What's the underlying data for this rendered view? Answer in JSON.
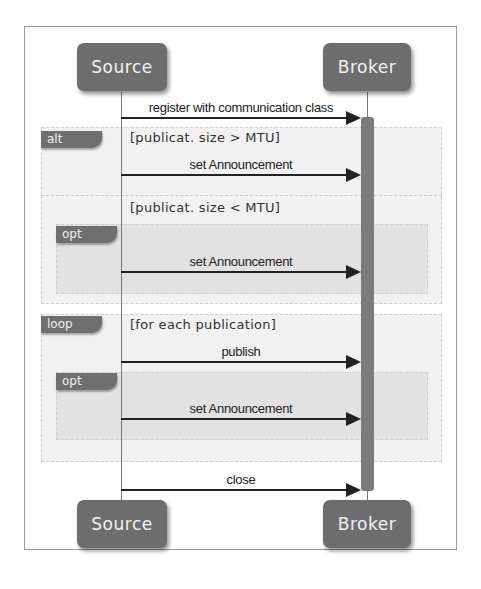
{
  "diagram": {
    "type": "sequence",
    "participants": [
      {
        "id": "source",
        "label": "Source"
      },
      {
        "id": "broker",
        "label": "Broker"
      }
    ],
    "messages": [
      {
        "label": "register with communication class",
        "from": "Source",
        "to": "Broker"
      },
      {
        "label": "set Announcement",
        "from": "Source",
        "to": "Broker",
        "frame": "alt [publicat. size > MTU]"
      },
      {
        "label": "set Announcement",
        "from": "Source",
        "to": "Broker",
        "frame": "opt within alt [publicat. size < MTU]"
      },
      {
        "label": "publish",
        "from": "Source",
        "to": "Broker",
        "frame": "loop [for each publication]"
      },
      {
        "label": "set Announcement",
        "from": "Source",
        "to": "Broker",
        "frame": "opt within loop"
      },
      {
        "label": "close",
        "from": "Source",
        "to": "Broker"
      }
    ],
    "frames": {
      "alt": {
        "tag": "alt",
        "guard1": "[publicat. size > MTU]",
        "guard2": "[publicat. size < MTU]"
      },
      "opt1": {
        "tag": "opt"
      },
      "loop": {
        "tag": "loop",
        "guard": "[for each publication]"
      },
      "opt2": {
        "tag": "opt"
      }
    },
    "colors": {
      "actor_fill": "#6d6d6d",
      "activation": "#7b7b7b",
      "frame_fill": "#f1f1f1",
      "inner_frame_fill": "#e2e2e2",
      "arrow": "#222222"
    }
  }
}
